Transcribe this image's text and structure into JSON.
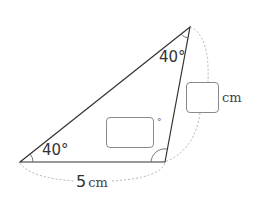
{
  "diagram": {
    "type": "triangle",
    "vertices": {
      "left": [
        20,
        162
      ],
      "top": [
        190,
        27
      ],
      "bottom_right": [
        165,
        162
      ]
    },
    "angles": {
      "left": "40°",
      "top": "40°",
      "bottom_right": {
        "value": "",
        "unit": "°",
        "blank": true
      }
    },
    "sides": {
      "bottom": {
        "value": "5",
        "unit": "cm"
      },
      "right": {
        "value": "",
        "unit": "cm",
        "blank": true
      }
    },
    "colors": {
      "line": "#333333",
      "dotted": "#aaaaaa",
      "box_border": "#8a8a8a"
    }
  }
}
